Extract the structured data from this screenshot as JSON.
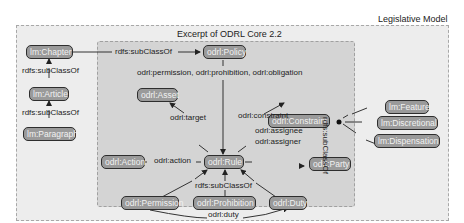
{
  "outer_title": "Legislative Model",
  "inner_title": "Excerpt of ODRL Core 2.2",
  "colors": {
    "outer_fill": "#ececec",
    "inner_fill": "#d3d3d3",
    "node_fill": "#9a9a9a",
    "node_border": "#2e2e2e",
    "border_dash": "#9a9a9a"
  },
  "nodes": {
    "chapter": "lm:Chapter",
    "article": "lm:Article",
    "paragraph": "lm:Paragraph",
    "policy": "odrl:Policy",
    "asset": "odrl:Asset",
    "constraint": "odrl:Constraint",
    "action": "odrl:Action",
    "rule": "odrl:Rule",
    "party": "odrl:Party",
    "permission": "odrl:Permission",
    "prohibition": "odrl:Prohibition",
    "duty": "odrl:Duty",
    "feature": "lm:Feature",
    "discretional": "lm:Discretional",
    "dispensation": "lm:Dispensation"
  },
  "edges": {
    "chapter_policy": "rdfs:subClassOf",
    "article_chapter": "rdfs:subClassOf",
    "paragraph_article": "rdfs:subClassOf",
    "policy_rule": "odrl:permission, odrl:prohibition, odrl:obligation",
    "rule_asset": "odrl:target",
    "rule_constraint": "odrl:constraint",
    "rule_action": "odrl:action",
    "rule_party_1": "odrl:assignee",
    "rule_party_2": "odrl:assigner",
    "subtypes_rule": "rdfs:subClassOf",
    "permission_duty": "odrl:duty",
    "lm_constraint": "rdfs:subClassOf"
  }
}
